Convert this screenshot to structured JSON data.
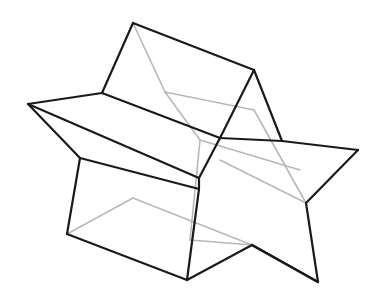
{
  "figure": {
    "colors": {
      "background": "#ffffff",
      "front_edge": "#1a1a1a",
      "hidden_edge": "#b8b8b8"
    },
    "front_edges": [
      [
        133,
        23,
        102,
        93
      ],
      [
        102,
        93,
        28,
        104
      ],
      [
        133,
        23,
        254,
        70
      ],
      [
        28,
        104,
        199,
        178
      ],
      [
        102,
        93,
        220,
        138
      ],
      [
        220,
        138,
        199,
        178
      ],
      [
        254,
        70,
        220,
        138
      ],
      [
        254,
        70,
        282,
        141
      ],
      [
        282,
        141,
        358,
        150
      ],
      [
        220,
        138,
        282,
        141
      ],
      [
        28,
        104,
        80,
        158
      ],
      [
        80,
        158,
        199,
        189
      ],
      [
        80,
        158,
        67,
        234
      ],
      [
        67,
        234,
        187,
        280
      ],
      [
        199,
        189,
        187,
        280
      ],
      [
        199,
        178,
        199,
        189
      ],
      [
        187,
        280,
        252,
        245
      ],
      [
        252,
        245,
        318,
        282
      ],
      [
        318,
        282,
        306,
        203
      ],
      [
        306,
        203,
        358,
        150
      ],
      [
        252,
        245,
        318,
        282
      ]
    ],
    "hidden_edges": [
      [
        133,
        23,
        165,
        92
      ],
      [
        165,
        92,
        254,
        110
      ],
      [
        165,
        92,
        200,
        140
      ],
      [
        67,
        234,
        133,
        198
      ],
      [
        133,
        198,
        252,
        245
      ],
      [
        200,
        140,
        190,
        240
      ],
      [
        190,
        240,
        252,
        245
      ],
      [
        220,
        160,
        306,
        203
      ],
      [
        254,
        110,
        306,
        203
      ],
      [
        200,
        140,
        300,
        170
      ]
    ]
  }
}
